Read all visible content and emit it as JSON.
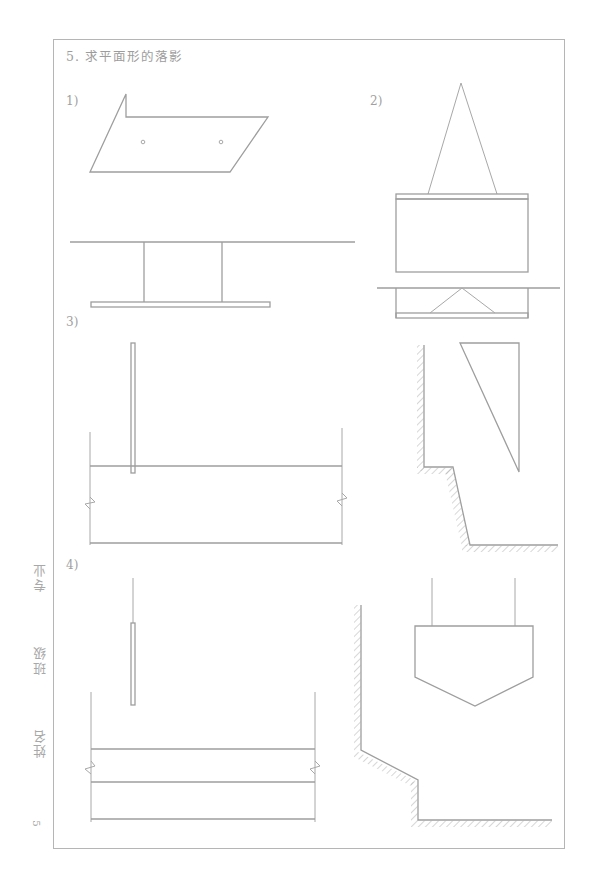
{
  "page": {
    "title": "5. 求平面形的落影",
    "page_number": "5",
    "side_labels": [
      "专业",
      "班级",
      "姓名"
    ]
  },
  "exercises": [
    {
      "label": "1)",
      "description": "Planar pentagon shape above a ground line with a rectangular wall"
    },
    {
      "label": "2)",
      "description": "Triangle above a rectangular slab with plan view below"
    },
    {
      "label": "3)",
      "description": "Vertical thin plate and right triangle against stepped wall"
    },
    {
      "label": "4)",
      "description": "Suspended thin plate and pentagon sign against sloped stepped wall"
    }
  ],
  "colors": {
    "line": "#9e9e9e",
    "frame": "#b5b5b5",
    "text": "#9c9c9c"
  }
}
